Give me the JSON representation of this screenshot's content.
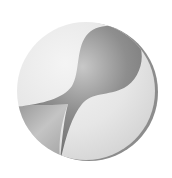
{
  "image": {
    "description": "Grayscale circular emblem with a dark hourglass / bulb shape",
    "colors": {
      "background": "#ffffff",
      "disc_light": "#ebebeb",
      "disc_mid": "#d6d6d6",
      "shape_dark": "#7a7a7a",
      "shape_mid": "#a8a8a8",
      "rim_shadow": "#8c8c8c"
    }
  }
}
